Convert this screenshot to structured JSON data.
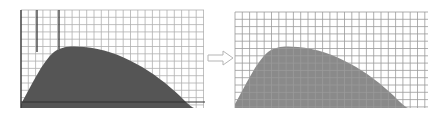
{
  "figure": {
    "colors": {
      "background": "#ffffff",
      "grid_line": "#a9a9a9",
      "axis_line": "#333333",
      "shape_left": "#555555",
      "shape_right": "#8a8a8a",
      "arrow_stroke": "#b5b5b5"
    },
    "left_panel": {
      "label": "before",
      "grid": {
        "x0": 21,
        "x1": 204,
        "y0": 10,
        "y1": 108,
        "step": 7.3
      },
      "highlighted_verticals": [
        21,
        37,
        59
      ],
      "axis_y": 102,
      "shape_layer": "above-grid"
    },
    "arrow": {
      "icon": "hollow-right-arrow-icon",
      "direction": "right"
    },
    "right_panel": {
      "label": "after",
      "grid": {
        "x0": 7,
        "x1": 200,
        "y0": 12,
        "y1": 108,
        "step": 7.3
      },
      "shape_layer": "below-grid"
    }
  }
}
